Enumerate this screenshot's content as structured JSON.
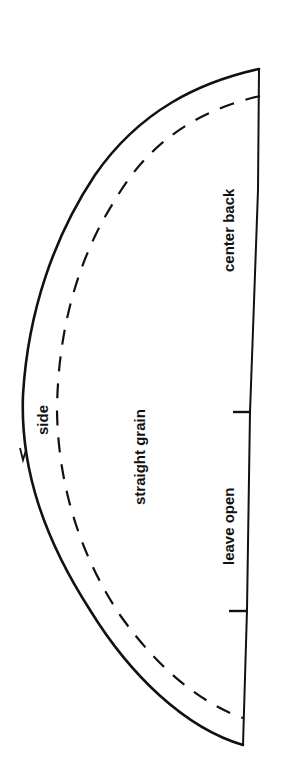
{
  "diagram": {
    "type": "sewing-pattern-piece",
    "shape": "half-circle",
    "line_color": "#111111",
    "background": "#ffffff",
    "labels": {
      "center_back": "center back",
      "straight_grain": "straight grain",
      "leave_open": "leave open",
      "side": "side"
    },
    "lines": {
      "cutting_line": "solid",
      "seam_line": "dashed"
    },
    "marks": {
      "straight_edge_ticks": 2,
      "curve_notches": 1
    }
  }
}
